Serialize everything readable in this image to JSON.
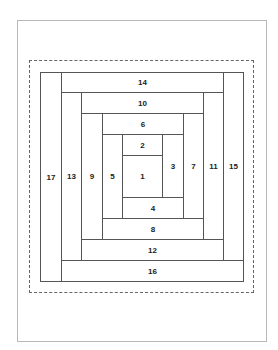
{
  "diagram": {
    "line_color": "#555555",
    "page_border_color": "#b8b8b8",
    "seam_allowance_style": "dashed",
    "pieces": [
      {
        "label": "1",
        "x": 122,
        "y": 155,
        "w": 41,
        "h": 43
      },
      {
        "label": "2",
        "x": 122,
        "y": 134,
        "w": 41,
        "h": 22
      },
      {
        "label": "3",
        "x": 162,
        "y": 134,
        "w": 22,
        "h": 64
      },
      {
        "label": "4",
        "x": 122,
        "y": 197,
        "w": 62,
        "h": 22
      },
      {
        "label": "5",
        "x": 102,
        "y": 134,
        "w": 21,
        "h": 85
      },
      {
        "label": "6",
        "x": 102,
        "y": 113,
        "w": 82,
        "h": 22
      },
      {
        "label": "7",
        "x": 183,
        "y": 113,
        "w": 21,
        "h": 106
      },
      {
        "label": "8",
        "x": 102,
        "y": 218,
        "w": 102,
        "h": 22
      },
      {
        "label": "9",
        "x": 81,
        "y": 113,
        "w": 22,
        "h": 127
      },
      {
        "label": "10",
        "x": 81,
        "y": 92,
        "w": 123,
        "h": 22
      },
      {
        "label": "11",
        "x": 203,
        "y": 92,
        "w": 21,
        "h": 148
      },
      {
        "label": "12",
        "x": 81,
        "y": 239,
        "w": 143,
        "h": 22
      },
      {
        "label": "13",
        "x": 61,
        "y": 92,
        "w": 21,
        "h": 169
      },
      {
        "label": "14",
        "x": 61,
        "y": 72,
        "w": 163,
        "h": 21
      },
      {
        "label": "15",
        "x": 223,
        "y": 72,
        "w": 21,
        "h": 189
      },
      {
        "label": "16",
        "x": 61,
        "y": 260,
        "w": 183,
        "h": 22
      },
      {
        "label": "17",
        "x": 40,
        "y": 72,
        "w": 22,
        "h": 210
      }
    ]
  }
}
